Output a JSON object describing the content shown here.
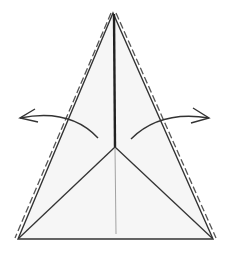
{
  "diagram": {
    "type": "origami-step",
    "colors": {
      "paper": "#f6f6f6",
      "outline": "#333333",
      "crease_thin": "#999999",
      "dash": "#555555",
      "arrow": "#333333"
    },
    "points": {
      "apex": [
        113,
        13
      ],
      "bottom_left": [
        18,
        239
      ],
      "bottom_right": [
        213,
        239
      ],
      "center": [
        115,
        147
      ],
      "center_bottom": [
        116,
        234
      ]
    },
    "arrows": [
      {
        "name": "left",
        "direction": "outward-left"
      },
      {
        "name": "right",
        "direction": "outward-right"
      }
    ]
  }
}
